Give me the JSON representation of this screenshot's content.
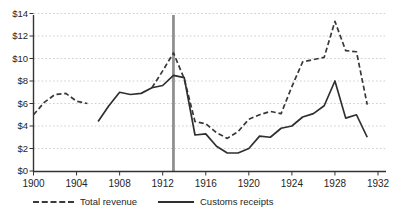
{
  "chart_data": {
    "type": "line",
    "title": "",
    "xlabel": "",
    "ylabel": "",
    "x_range": [
      1900,
      1932
    ],
    "y_range": [
      0,
      14
    ],
    "x_ticks": [
      1900,
      1904,
      1908,
      1912,
      1916,
      1920,
      1924,
      1928,
      1932
    ],
    "y_ticks": [
      0,
      2,
      4,
      6,
      8,
      10,
      12,
      14
    ],
    "y_tick_labels": [
      "$0",
      "$2",
      "$4",
      "$6",
      "$8",
      "$10",
      "$12",
      "$14"
    ],
    "grid": "horizontal-dotted",
    "legend_position": "bottom",
    "years": [
      1900,
      1901,
      1902,
      1903,
      1904,
      1905,
      1906,
      1907,
      1908,
      1909,
      1910,
      1911,
      1912,
      1913,
      1914,
      1915,
      1916,
      1917,
      1918,
      1919,
      1920,
      1921,
      1922,
      1923,
      1924,
      1925,
      1926,
      1927,
      1928,
      1929,
      1930,
      1931
    ],
    "series": [
      {
        "name": "Total revenue",
        "style": "dashed",
        "color": "#383838",
        "values": [
          5.0,
          6.1,
          6.8,
          6.9,
          6.2,
          6.0,
          null,
          null,
          null,
          null,
          null,
          7.4,
          8.9,
          10.5,
          8.2,
          4.4,
          4.2,
          3.4,
          2.9,
          3.5,
          4.6,
          5.0,
          5.3,
          5.1,
          7.5,
          9.7,
          9.9,
          10.1,
          13.3,
          10.7,
          10.6,
          5.9
        ]
      },
      {
        "name": "Customs receipts",
        "style": "solid",
        "color": "#2f2f2f",
        "values": [
          null,
          null,
          null,
          null,
          null,
          null,
          4.4,
          5.8,
          7.0,
          6.8,
          6.9,
          7.4,
          7.6,
          8.5,
          8.3,
          3.2,
          3.3,
          2.2,
          1.6,
          1.6,
          2.0,
          3.1,
          3.0,
          3.8,
          4.0,
          4.8,
          5.1,
          5.8,
          8.0,
          4.7,
          5.0,
          3.0
        ]
      }
    ],
    "annotations": [
      {
        "type": "vline",
        "x": 1913,
        "color": "#909090",
        "width": 2.8
      }
    ],
    "colors": {
      "axis": "#333333",
      "grid": "#c9c9c9",
      "text": "#262626",
      "background": "#ffffff"
    }
  }
}
